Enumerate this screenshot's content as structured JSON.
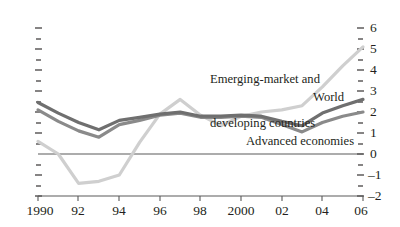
{
  "chart_data": {
    "type": "line",
    "title": "",
    "subtitle": "",
    "xlabel": "",
    "ylabel": "",
    "x": [
      1990,
      1991,
      1992,
      1993,
      1994,
      1995,
      1996,
      1997,
      1998,
      1999,
      2000,
      2001,
      2002,
      2003,
      2004,
      2005,
      2006
    ],
    "xlim": [
      1990,
      2006
    ],
    "ylim": [
      -2,
      6
    ],
    "yticks": [
      -2,
      -1,
      0,
      1,
      2,
      3,
      4,
      5,
      6
    ],
    "ytick_labels": [
      "–2",
      "–1",
      "0",
      "1",
      "2",
      "3",
      "4",
      "5",
      "6"
    ],
    "xticks": [
      1990,
      1992,
      1994,
      1996,
      1998,
      2000,
      2002,
      2004,
      2006
    ],
    "xtick_labels": [
      "1990",
      "92",
      "94",
      "96",
      "98",
      "2000",
      "02",
      "04",
      "06"
    ],
    "minor_yticks": [
      -1.5,
      -0.5,
      0.5,
      1.5,
      2.5,
      3.5,
      4.5,
      5.5
    ],
    "grid": false,
    "legend_position": "inline-annotations",
    "zero_line": true,
    "axis_sides": [
      "left-ticks-only",
      "right-labeled"
    ],
    "series": [
      {
        "name": "World",
        "color": "#6f6f6f",
        "linewidth": 3.2,
        "label_text": "World",
        "values": [
          2.45,
          1.95,
          1.5,
          1.15,
          1.6,
          1.75,
          1.9,
          2.0,
          1.8,
          1.8,
          1.85,
          1.8,
          1.55,
          1.35,
          1.95,
          2.3,
          2.6
        ]
      },
      {
        "name": "Advanced economies",
        "color": "#8a8a8a",
        "linewidth": 3.2,
        "label_text": "Advanced economies",
        "values": [
          2.1,
          1.55,
          1.1,
          0.8,
          1.4,
          1.6,
          1.85,
          1.95,
          1.75,
          1.75,
          1.8,
          1.75,
          1.4,
          1.05,
          1.5,
          1.8,
          2.0
        ]
      },
      {
        "name": "Emerging-market and developing countries",
        "color": "#cfcfcf",
        "linewidth": 3.2,
        "label_text": "Emerging-market and\ndeveloping countries",
        "values": [
          0.6,
          0.0,
          -1.4,
          -1.3,
          -1.0,
          0.55,
          1.9,
          2.6,
          1.85,
          1.35,
          1.8,
          2.0,
          2.1,
          2.3,
          3.2,
          4.2,
          5.1
        ]
      }
    ],
    "annotations": [
      {
        "text": "Emerging-market and\ndeveloping countries",
        "series": "Emerging-market and developing countries"
      },
      {
        "text": "World",
        "series": "World"
      },
      {
        "text": "Advanced economies",
        "series": "Advanced economies"
      }
    ]
  },
  "annotations": {
    "emerging": "Emerging-market and\ndeveloping countries",
    "emerging_line1": "Emerging-market and",
    "emerging_line2": "developing countries",
    "world": "World",
    "advanced": "Advanced economies"
  },
  "yaxis": {
    "labels": [
      "6",
      "5",
      "4",
      "3",
      "2",
      "1",
      "0",
      "–1",
      "–2"
    ]
  },
  "xaxis": {
    "labels": [
      "1990",
      "92",
      "94",
      "96",
      "98",
      "2000",
      "02",
      "04",
      "06"
    ]
  }
}
